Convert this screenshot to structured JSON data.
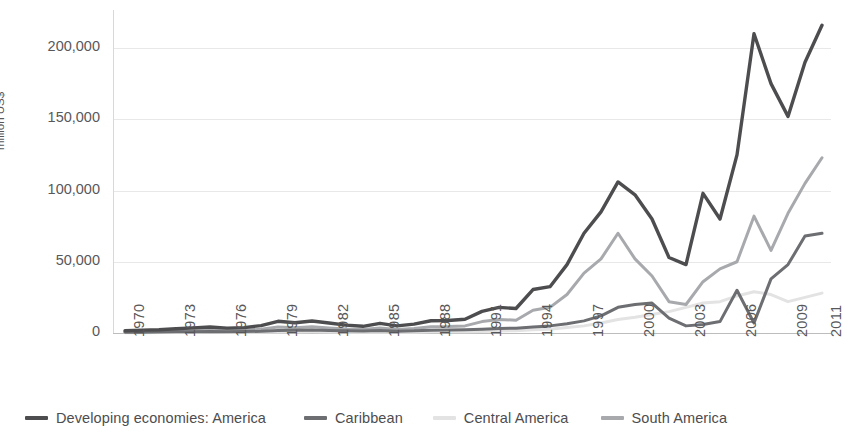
{
  "chart_data": {
    "type": "line",
    "title": "",
    "subtitle": "",
    "xlabel": "",
    "ylabel": "million US$",
    "ylim": [
      0,
      230000
    ],
    "yticks": [
      0,
      50000,
      100000,
      150000,
      200000
    ],
    "ytick_labels": [
      "0",
      "50,000",
      "100,000",
      "150,000",
      "200,000"
    ],
    "grid": true,
    "legend_position": "bottom",
    "x": [
      1970,
      1971,
      1972,
      1973,
      1974,
      1975,
      1976,
      1977,
      1978,
      1979,
      1980,
      1981,
      1982,
      1983,
      1984,
      1985,
      1986,
      1987,
      1988,
      1989,
      1990,
      1991,
      1992,
      1993,
      1994,
      1995,
      1996,
      1997,
      1998,
      1999,
      2000,
      2001,
      2002,
      2003,
      2004,
      2005,
      2006,
      2007,
      2008,
      2009,
      2010,
      2011
    ],
    "xtick_labels": [
      "1970",
      "1973",
      "1976",
      "1979",
      "1982",
      "1985",
      "1988",
      "1991",
      "1994",
      "1997",
      "2000",
      "2003",
      "2006",
      "2009",
      "2011"
    ],
    "xtick_years": [
      1970,
      1973,
      1976,
      1979,
      1982,
      1985,
      1988,
      1991,
      1994,
      1997,
      2000,
      2003,
      2006,
      2009,
      2011
    ],
    "series": [
      {
        "name": "Developing economies: America",
        "color": "#4d4d4f",
        "width": 3.4,
        "values": [
          1600,
          2000,
          2300,
          3000,
          3600,
          4200,
          3400,
          3800,
          5200,
          8200,
          7200,
          8400,
          7000,
          5500,
          4700,
          6800,
          5000,
          6200,
          8600,
          8800,
          9700,
          15200,
          18000,
          17200,
          30500,
          32500,
          48000,
          70000,
          85000,
          106000,
          97000,
          80000,
          53000,
          48000,
          98000,
          80000,
          125000,
          210000,
          175000,
          152000,
          190000,
          216000
        ]
      },
      {
        "name": "Caribbean",
        "color": "#6d6e71",
        "width": 3.0,
        "values": [
          500,
          600,
          700,
          800,
          900,
          1100,
          900,
          1000,
          1200,
          1800,
          1900,
          2100,
          1800,
          1500,
          1400,
          1800,
          1300,
          1500,
          2000,
          2100,
          2300,
          2600,
          3100,
          3400,
          4200,
          5000,
          6500,
          8500,
          12000,
          18000,
          20000,
          21000,
          10500,
          5000,
          6000,
          8000,
          30000,
          7000,
          38000,
          48000,
          68000,
          70000
        ]
      },
      {
        "name": "Central America",
        "color": "#e3e3e3",
        "width": 3.0,
        "values": [
          200,
          250,
          300,
          350,
          400,
          450,
          400,
          450,
          500,
          700,
          750,
          800,
          700,
          600,
          550,
          700,
          500,
          600,
          800,
          850,
          900,
          1100,
          1400,
          1600,
          2200,
          2700,
          3800,
          5000,
          7000,
          9500,
          11000,
          13000,
          15000,
          18000,
          21000,
          22000,
          26000,
          29000,
          27000,
          22000,
          25000,
          28000
        ]
      },
      {
        "name": "South America",
        "color": "#a7a9ac",
        "width": 3.0,
        "values": [
          800,
          1000,
          1200,
          1500,
          1800,
          2200,
          1700,
          1900,
          2600,
          4200,
          3600,
          4300,
          3500,
          2800,
          2400,
          3500,
          2500,
          3100,
          4400,
          4500,
          5000,
          8000,
          9500,
          9000,
          16000,
          18000,
          27000,
          42000,
          52000,
          70000,
          52000,
          40000,
          22000,
          20000,
          36000,
          45000,
          50000,
          82000,
          58000,
          84000,
          105000,
          123000
        ]
      }
    ]
  },
  "axis": {
    "y_title": "million US$"
  },
  "legend": {
    "items": [
      {
        "label": "Developing economies: America",
        "color": "#4d4d4f"
      },
      {
        "label": "Caribbean",
        "color": "#6d6e71"
      },
      {
        "label": "Central America",
        "color": "#e3e3e3"
      },
      {
        "label": "South America",
        "color": "#a7a9ac"
      }
    ]
  }
}
